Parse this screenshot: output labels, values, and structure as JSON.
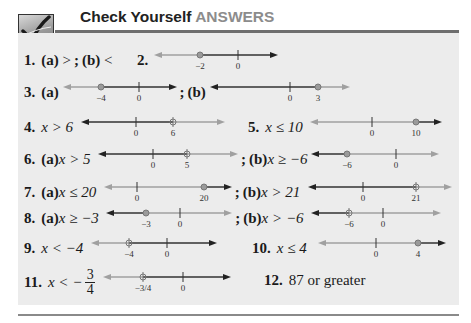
{
  "header": {
    "icon": "checkmark-icon",
    "title_prefix": "Check Yourself",
    "title_accent": "ANSWERS"
  },
  "colors": {
    "panel_bg": "#ececec",
    "rule": "#6e6e6e",
    "accent_gray": "#8c8c8c",
    "solution_line": "#333333",
    "nonsolution_line": "#a0a0a0",
    "point": "#9a9a9a"
  },
  "answers": [
    {
      "number": "1.",
      "parts": [
        {
          "label": "(a)",
          "text": ">"
        },
        {
          "label": "(b)",
          "text": "<"
        }
      ]
    },
    {
      "number": "2.",
      "number_line": {
        "ticks": [
          "−2",
          "0"
        ],
        "point": "−2",
        "shaded": "right"
      }
    },
    {
      "number": "3.",
      "parts": [
        {
          "label": "(a)",
          "number_line": {
            "ticks": [
              "−4",
              "0"
            ],
            "point": "−4",
            "shaded": "right"
          }
        },
        {
          "label": "(b)",
          "number_line": {
            "ticks": [
              "0",
              "3"
            ],
            "point": "3",
            "shaded": "left"
          }
        }
      ]
    },
    {
      "number": "4.",
      "text": "x > 6",
      "number_line": {
        "ticks": [
          "0",
          "6"
        ],
        "point": "6",
        "shaded": "left"
      }
    },
    {
      "number": "5.",
      "text": "x ≤ 10",
      "number_line": {
        "ticks": [
          "0",
          "10"
        ],
        "point": "10",
        "shaded": "right"
      }
    },
    {
      "number": "6.",
      "parts": [
        {
          "label": "(a)",
          "text": "x > 5",
          "number_line": {
            "ticks": [
              "0",
              "5"
            ],
            "point": "5",
            "shaded": "left"
          }
        },
        {
          "label": "(b)",
          "text": "x ≥ −6",
          "number_line": {
            "ticks": [
              "−6",
              "0"
            ],
            "point": "−6",
            "shaded": "left"
          }
        }
      ]
    },
    {
      "number": "7.",
      "parts": [
        {
          "label": "(a)",
          "text": "x ≤ 20",
          "number_line": {
            "ticks": [
              "0",
              "20"
            ],
            "point": "20",
            "shaded": "right"
          }
        },
        {
          "label": "(b)",
          "text": "x > 21",
          "number_line": {
            "ticks": [
              "0",
              "21"
            ],
            "point": "21",
            "shaded": "left"
          }
        }
      ]
    },
    {
      "number": "8.",
      "parts": [
        {
          "label": "(a)",
          "text": "x ≥ −3",
          "number_line": {
            "ticks": [
              "−3",
              "0"
            ],
            "point": "−3",
            "shaded": "left"
          }
        },
        {
          "label": "(b)",
          "text": "x > −6",
          "number_line": {
            "ticks": [
              "−6",
              "0"
            ],
            "point": "−6",
            "shaded": "left"
          }
        }
      ]
    },
    {
      "number": "9.",
      "text": "x < −4",
      "number_line": {
        "ticks": [
          "−4",
          "0"
        ],
        "point": "−4",
        "shaded": "right"
      }
    },
    {
      "number": "10.",
      "text": "x ≤ 4",
      "number_line": {
        "ticks": [
          "0",
          "4"
        ],
        "point": "4",
        "shaded": "right"
      }
    },
    {
      "number": "11.",
      "text": "x < −",
      "fraction": {
        "numerator": "3",
        "denominator": "4"
      },
      "number_line": {
        "ticks": [
          "−3/4",
          "0"
        ],
        "point": "−3/4",
        "shaded": "right"
      }
    },
    {
      "number": "12.",
      "text": "87 or greater"
    }
  ],
  "labels": {
    "a1_num": "1.",
    "a1a": "(a)",
    "a1a_val": ">",
    "a1_sep": ";",
    "a1b": "(b)",
    "a1b_val": "<",
    "a2_num": "2.",
    "a2_t1": "−2",
    "a2_t2": "0",
    "a3_num": "3.",
    "a3a": "(a)",
    "a3a_t1": "−4",
    "a3a_t2": "0",
    "a3_sep": ";",
    "a3b": "(b)",
    "a3b_t1": "0",
    "a3b_t2": "3",
    "a4_num": "4.",
    "a4_text": "x > 6",
    "a4_t1": "0",
    "a4_t2": "6",
    "a5_num": "5.",
    "a5_text": "x ≤ 10",
    "a5_t1": "0",
    "a5_t2": "10",
    "a6_num": "6.",
    "a6a": "(a)",
    "a6a_text": "x > 5",
    "a6a_t1": "0",
    "a6a_t2": "5",
    "a6_sep": ";",
    "a6b": "(b)",
    "a6b_text": "x ≥ −6",
    "a6b_t1": "−6",
    "a6b_t2": "0",
    "a7_num": "7.",
    "a7a": "(a)",
    "a7a_text": "x ≤ 20",
    "a7a_t1": "0",
    "a7a_t2": "20",
    "a7_sep": ";",
    "a7b": "(b)",
    "a7b_text": "x > 21",
    "a7b_t1": "0",
    "a7b_t2": "21",
    "a8_num": "8.",
    "a8a": "(a)",
    "a8a_text": "x ≥ −3",
    "a8a_t1": "−3",
    "a8a_t2": "0",
    "a8_sep": ";",
    "a8b": "(b)",
    "a8b_text": "x > −6",
    "a8b_t1": "−6",
    "a8b_t2": "0",
    "a9_num": "9.",
    "a9_text": "x < −4",
    "a9_t1": "−4",
    "a9_t2": "0",
    "a10_num": "10.",
    "a10_text": "x ≤ 4",
    "a10_t1": "0",
    "a10_t2": "4",
    "a11_num": "11.",
    "a11_text": "x < −",
    "a11_frac_num": "3",
    "a11_frac_den": "4",
    "a11_t1": "−3/4",
    "a11_t2": "0",
    "a12_num": "12.",
    "a12_text": "87 or greater"
  }
}
